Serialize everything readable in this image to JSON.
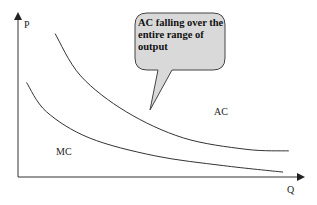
{
  "chart_data": {
    "type": "line",
    "title": "",
    "xlabel": "Q",
    "ylabel": "P",
    "grid": false,
    "series": [
      {
        "name": "AC",
        "label": "AC",
        "shape": "falling convex curve over entire output range",
        "points": [
          [
            0.13,
            0.88
          ],
          [
            0.22,
            0.62
          ],
          [
            0.38,
            0.4
          ],
          [
            0.58,
            0.24
          ],
          [
            0.8,
            0.17
          ],
          [
            0.95,
            0.16
          ]
        ]
      },
      {
        "name": "MC",
        "label": "MC",
        "shape": "falling convex curve below AC",
        "points": [
          [
            0.03,
            0.58
          ],
          [
            0.1,
            0.4
          ],
          [
            0.25,
            0.24
          ],
          [
            0.48,
            0.13
          ],
          [
            0.72,
            0.07
          ],
          [
            0.93,
            0.03
          ]
        ]
      }
    ],
    "annotations": [
      {
        "type": "callout",
        "text_lines": [
          "AC falling over the",
          "entire range of",
          "output"
        ],
        "points_to": "AC"
      }
    ]
  },
  "colors": {
    "curve": "#333333",
    "axis": "#333333",
    "callout_fill": "#d9d9d9",
    "callout_stroke": "#444444"
  }
}
